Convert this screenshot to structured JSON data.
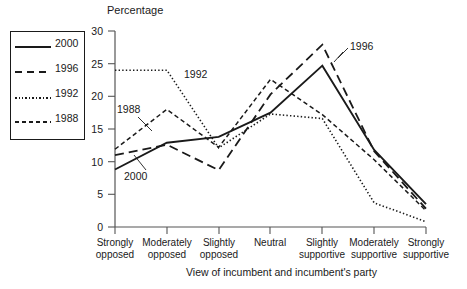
{
  "chart_data": {
    "type": "line",
    "title": "",
    "ylabel": "Percentage",
    "xlabel": "View of incumbent and incumbent's party",
    "categories": [
      "Strongly opposed",
      "Moderately opposed",
      "Slightly opposed",
      "Neutral",
      "Slightly supportive",
      "Moderately supportive",
      "Strongly supportive"
    ],
    "ylim": [
      0,
      30
    ],
    "yticks": [
      0,
      5,
      10,
      15,
      20,
      25,
      30
    ],
    "grid": false,
    "legend_position": "upper-left-box",
    "series": [
      {
        "name": "2000",
        "style": "solid",
        "values": [
          8.8,
          12.9,
          13.8,
          17.5,
          24.7,
          11.8,
          3.5
        ]
      },
      {
        "name": "1996",
        "style": "long-dashed",
        "values": [
          11.0,
          12.6,
          8.7,
          20.3,
          27.9,
          11.6,
          2.8
        ]
      },
      {
        "name": "1992",
        "style": "dotted",
        "values": [
          24.0,
          24.0,
          12.1,
          17.3,
          16.6,
          3.7,
          0.8
        ]
      },
      {
        "name": "1988",
        "style": "short-dashed",
        "values": [
          11.9,
          18.0,
          12.2,
          22.6,
          17.2,
          10.3,
          2.5
        ]
      }
    ],
    "annotations": [
      {
        "text": "1992",
        "series": "1992"
      },
      {
        "text": "1996",
        "series": "1996"
      },
      {
        "text": "1988",
        "series": "1988"
      },
      {
        "text": "2000",
        "series": "2000"
      }
    ]
  },
  "legend": {
    "items": [
      {
        "label": "2000"
      },
      {
        "label": "1996"
      },
      {
        "label": "1992"
      },
      {
        "label": "1988"
      }
    ]
  },
  "axes": {
    "y_title": "Percentage",
    "x_title": "View of incumbent and incumbent's party",
    "y_ticks": [
      "30",
      "25",
      "20",
      "15",
      "10",
      "5",
      "0"
    ],
    "x_ticks": [
      {
        "line1": "Strongly",
        "line2": "opposed"
      },
      {
        "line1": "Moderately",
        "line2": "opposed"
      },
      {
        "line1": "Slightly",
        "line2": "opposed"
      },
      {
        "line1": "Neutral",
        "line2": ""
      },
      {
        "line1": "Slightly",
        "line2": "supportive"
      },
      {
        "line1": "Moderately",
        "line2": "supportive"
      },
      {
        "line1": "Strongly",
        "line2": "supportive"
      }
    ]
  },
  "colors": {
    "ink": "#1a1a1a",
    "axis": "#555555",
    "background": "#ffffff"
  }
}
